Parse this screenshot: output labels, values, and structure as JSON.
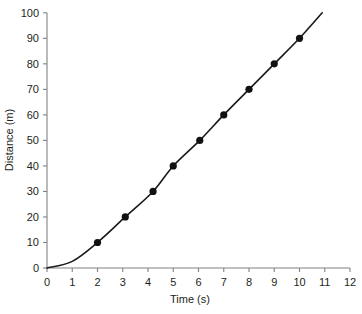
{
  "chart_data": {
    "type": "scatter",
    "title": "",
    "subtitle": "",
    "xlabel": "Time (s)",
    "ylabel": "Distance (m)",
    "xlim": [
      0,
      12
    ],
    "ylim": [
      0,
      100
    ],
    "grid": false,
    "legend": null,
    "x_ticks": [
      0,
      1,
      2,
      3,
      4,
      5,
      6,
      7,
      8,
      9,
      10,
      11,
      12
    ],
    "x_tick_labels": [
      "0",
      "1",
      "2",
      "3",
      "4",
      "5",
      "6",
      "7",
      "8",
      "9",
      "10",
      "11",
      "12"
    ],
    "y_ticks": [
      0,
      10,
      20,
      30,
      40,
      50,
      60,
      70,
      80,
      90,
      100
    ],
    "y_tick_labels": [
      "0",
      "10",
      "20",
      "30",
      "40",
      "50",
      "60",
      "70",
      "80",
      "90",
      "100"
    ],
    "series": [
      {
        "name": "Distance vs Time",
        "marker": "filled-circle",
        "marker_color": "#111111",
        "line_color": "#1a1a1a",
        "points": [
          {
            "x": 2.0,
            "y": 10
          },
          {
            "x": 3.1,
            "y": 20
          },
          {
            "x": 4.2,
            "y": 30
          },
          {
            "x": 5.0,
            "y": 40
          },
          {
            "x": 6.05,
            "y": 50
          },
          {
            "x": 7.0,
            "y": 60
          },
          {
            "x": 8.0,
            "y": 70
          },
          {
            "x": 9.0,
            "y": 80
          },
          {
            "x": 10.0,
            "y": 90
          }
        ],
        "fit_curve": {
          "description": "smooth accelerating curve through origin extending past last point",
          "x_start": 0.0,
          "x_end": 10.9,
          "y_start": 0,
          "y_end": 100,
          "control_points": [
            {
              "x": 0.0,
              "y": 0
            },
            {
              "x": 1.0,
              "y": 2.6
            },
            {
              "x": 2.0,
              "y": 10
            },
            {
              "x": 3.1,
              "y": 20
            },
            {
              "x": 4.2,
              "y": 30
            },
            {
              "x": 5.0,
              "y": 40
            },
            {
              "x": 6.05,
              "y": 50
            },
            {
              "x": 7.0,
              "y": 60
            },
            {
              "x": 8.0,
              "y": 70
            },
            {
              "x": 9.0,
              "y": 80
            },
            {
              "x": 10.0,
              "y": 90
            },
            {
              "x": 10.9,
              "y": 100
            }
          ]
        }
      }
    ],
    "colors": {
      "axis": "#808285",
      "text": "#231f20",
      "marker": "#111111",
      "curve": "#1a1a1a",
      "background": "#ffffff"
    }
  }
}
